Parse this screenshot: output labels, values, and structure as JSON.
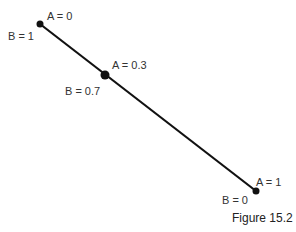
{
  "diagram": {
    "line": {
      "x1": 40,
      "y1": 24,
      "x2": 256,
      "y2": 191,
      "color": "#111111"
    },
    "points": [
      {
        "x": 40,
        "y": 24,
        "r": 3.5,
        "label_a": "A = 0",
        "label_b": "B = 1"
      },
      {
        "x": 105,
        "y": 75,
        "r": 4.5,
        "label_a": "A = 0.3",
        "label_b": "B = 0.7"
      },
      {
        "x": 256,
        "y": 191,
        "r": 3.5,
        "label_a": "A = 1",
        "label_b": "B = 0"
      }
    ]
  },
  "caption": "Figure 15.2"
}
